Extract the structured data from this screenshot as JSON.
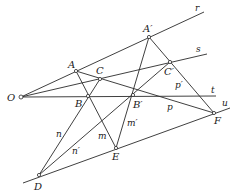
{
  "diagram": {
    "points": {
      "O": {
        "label": "O",
        "x": 21,
        "y": 97
      },
      "A": {
        "label": "A",
        "x": 76,
        "y": 71
      },
      "B": {
        "label": "B",
        "x": 88,
        "y": 96
      },
      "C": {
        "label": "C",
        "x": 100,
        "y": 79
      },
      "A_prime": {
        "label": "A′",
        "x": 149,
        "y": 37
      },
      "B_prime": {
        "label": "B′",
        "x": 133,
        "y": 95
      },
      "C_prime": {
        "label": "C′",
        "x": 170,
        "y": 62
      },
      "D": {
        "label": "D",
        "x": 39,
        "y": 175
      },
      "E": {
        "label": "E",
        "x": 116,
        "y": 148
      },
      "F": {
        "label": "F",
        "x": 214,
        "y": 113
      }
    },
    "lines": {
      "r": {
        "label": "r"
      },
      "s": {
        "label": "s"
      },
      "t": {
        "label": "t"
      },
      "u": {
        "label": "u"
      },
      "p": {
        "label": "p"
      },
      "p_prime": {
        "label": "p′"
      },
      "m": {
        "label": "m"
      },
      "m_prime": {
        "label": "m′"
      },
      "n": {
        "label": "n"
      },
      "n_prime": {
        "label": "n′"
      }
    },
    "stroke_color": "#2a2a2a",
    "background": "#ffffff"
  }
}
